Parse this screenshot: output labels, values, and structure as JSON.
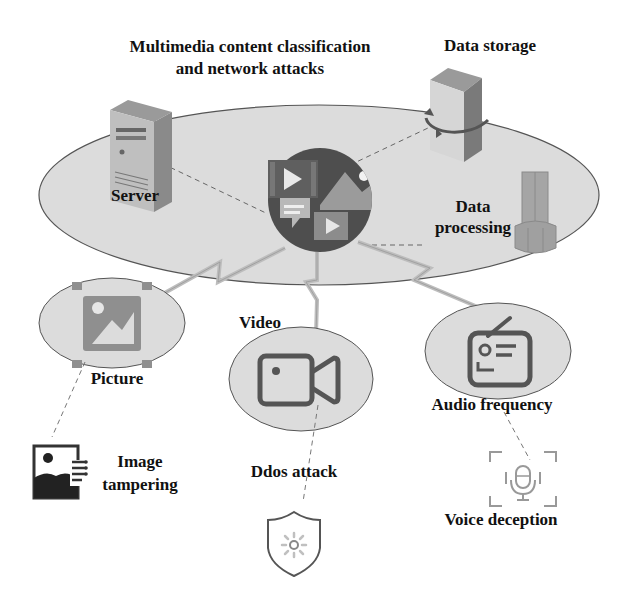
{
  "title": {
    "line1": "Multimedia content classification",
    "line2": "and network attacks"
  },
  "hub_nodes": {
    "server": "Server",
    "data_storage": "Data storage",
    "data_processing_line1": "Data",
    "data_processing_line2": "processing"
  },
  "media_types": {
    "picture": "Picture",
    "video": "Video",
    "audio": "Audio frequency"
  },
  "attacks": {
    "image_tampering_line1": "Image",
    "image_tampering_line2": "tampering",
    "ddos": "Ddos attack",
    "voice_deception": "Voice deception"
  },
  "colors": {
    "ellipse_fill": "#dcdcdc",
    "ellipse_stroke": "#555555",
    "icon_dark": "#555555",
    "icon_mid": "#888888",
    "icon_light": "#b5b5b5",
    "bolt": "#bdbdbd",
    "text": "#111111"
  }
}
